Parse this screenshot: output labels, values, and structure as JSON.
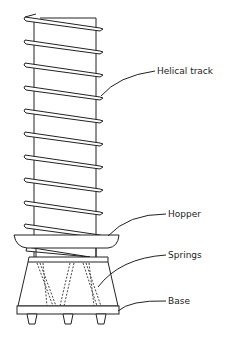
{
  "diagram": {
    "labels": {
      "helical_track": "Helical track",
      "hopper": "Hopper",
      "springs": "Springs",
      "base": "Base"
    },
    "track_turns": 12,
    "feet_count": 3
  }
}
